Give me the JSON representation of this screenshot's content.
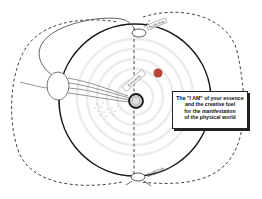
{
  "diagram": {
    "labels": {
      "north_pole": "North Pole",
      "south_pole": "South Pole",
      "emotions": "Emotions"
    },
    "callout": {
      "lines": [
        "The \"I AM\" of your essence",
        "and the creative fuel",
        "for the manifestation",
        "of the physical world"
      ]
    },
    "colors": {
      "outline": "#1a1a1a",
      "dashed": "#444444",
      "rings": "#e6e6e6",
      "red_dot": "#b8453a",
      "center_fill": "#c8c8c8",
      "background": "#ffffff"
    }
  }
}
